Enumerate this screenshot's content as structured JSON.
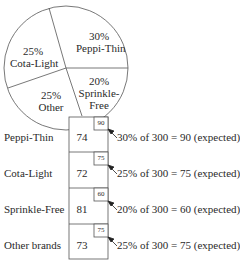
{
  "pie": {
    "slices": [
      {
        "percent": "30%",
        "name": "Peppi-Thin"
      },
      {
        "percent": "25%",
        "name": "Cota-Light"
      },
      {
        "percent": "25%",
        "name": "Other"
      },
      {
        "percent": "20%",
        "name": "Sprinkle-",
        "name2": "Free"
      }
    ]
  },
  "rows": [
    {
      "label": "Peppi-Thin",
      "observed": "74",
      "expected": "90",
      "annotation": "30% of 300 = 90 (expected)"
    },
    {
      "label": "Cota-Light",
      "observed": "72",
      "expected": "75",
      "annotation": "25% of 300 = 75 (expected)"
    },
    {
      "label": "Sprinkle-Free",
      "observed": "81",
      "expected": "60",
      "annotation": "20% of 300 = 60 (expected)"
    },
    {
      "label": "Other brands",
      "observed": "73",
      "expected": "75",
      "annotation": "25% of 300 = 75 (expected)"
    }
  ]
}
